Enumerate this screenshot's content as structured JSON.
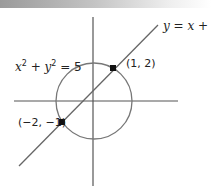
{
  "diagram": {
    "line_label": "y = x + 1",
    "circle_label_x": "x",
    "circle_label_y": "y",
    "circle_label_exp": "2",
    "circle_label_rest": " = 5",
    "point_a_label": "(1, 2)",
    "point_b_label": "(−2, −1)",
    "colors": {
      "axes": "#555555",
      "circle": "#777777",
      "line": "#666666",
      "points": "#111111",
      "topbar_start": "#9a9a9a"
    }
  }
}
